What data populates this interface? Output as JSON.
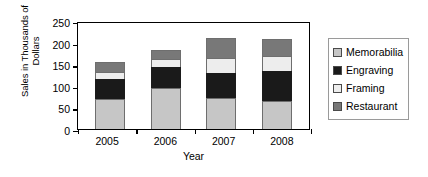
{
  "chart_data": {
    "type": "bar",
    "stacked": true,
    "title": "",
    "xlabel": "Year",
    "ylabel": "Sales in Thousands of Dollars",
    "categories": [
      "2005",
      "2006",
      "2007",
      "2008"
    ],
    "ylim": [
      0,
      250
    ],
    "yticks": [
      0,
      50,
      100,
      150,
      200,
      250
    ],
    "grid": false,
    "legend_position": "right",
    "series": [
      {
        "name": "Memorabilia",
        "color": "#c6c6c6",
        "values": [
          70,
          95,
          72,
          65
        ]
      },
      {
        "name": "Engraving",
        "color": "#1a1a1a",
        "values": [
          45,
          48,
          58,
          70
        ]
      },
      {
        "name": "Framing",
        "color": "#ededed",
        "values": [
          18,
          18,
          35,
          35
        ]
      },
      {
        "name": "Restaurant",
        "color": "#787878",
        "values": [
          22,
          22,
          45,
          38
        ]
      }
    ],
    "totals": [
      155,
      183,
      210,
      208
    ]
  },
  "legend": {
    "items": [
      {
        "label": "Memorabilia"
      },
      {
        "label": "Engraving"
      },
      {
        "label": "Framing"
      },
      {
        "label": "Restaurant"
      }
    ]
  }
}
